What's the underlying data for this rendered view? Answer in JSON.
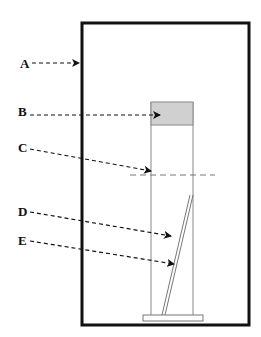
{
  "diagram": {
    "labels": [
      {
        "id": "A",
        "text": "A"
      },
      {
        "id": "B",
        "text": "B"
      },
      {
        "id": "C",
        "text": "C"
      },
      {
        "id": "D",
        "text": "D"
      },
      {
        "id": "E",
        "text": "E"
      }
    ],
    "colors": {
      "outline": "#111111",
      "cylinder_line": "#888888",
      "top_fill": "#d0d0d0",
      "dashed_line": "#777777"
    }
  }
}
